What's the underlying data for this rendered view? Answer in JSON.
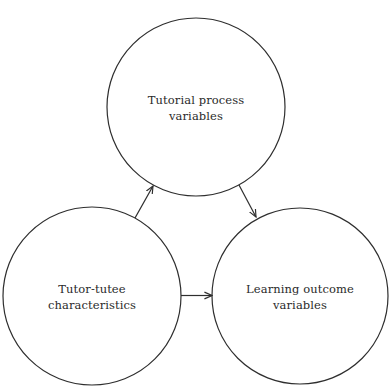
{
  "diagram": {
    "type": "flow",
    "colors": {
      "stroke": "#2e2e2e",
      "text": "#2a2a2a",
      "background": "#ffffff"
    },
    "nodes": [
      {
        "id": "tutorial-process",
        "lines": [
          "Tutorial process",
          "variables"
        ],
        "cx": 196,
        "cy": 107,
        "r": 89
      },
      {
        "id": "tutor-tutee",
        "lines": [
          "Tutor-tutee",
          "characteristics"
        ],
        "cx": 92,
        "cy": 296,
        "r": 89
      },
      {
        "id": "learning-outcome",
        "lines": [
          "Learning outcome",
          "variables"
        ],
        "cx": 300,
        "cy": 296,
        "r": 88
      }
    ],
    "edges": [
      {
        "from": "tutor-tutee",
        "to": "tutorial-process"
      },
      {
        "from": "tutorial-process",
        "to": "learning-outcome"
      },
      {
        "from": "tutor-tutee",
        "to": "learning-outcome"
      }
    ]
  }
}
